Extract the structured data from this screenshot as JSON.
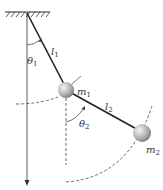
{
  "diagram": {
    "labels": {
      "l1": {
        "main": "l",
        "sub": "1"
      },
      "l2": {
        "main": "l",
        "sub": "2"
      },
      "theta1": {
        "main": "θ",
        "sub": "1"
      },
      "theta2": {
        "main": "θ",
        "sub": "2"
      },
      "m1": {
        "main": "m",
        "sub": "1"
      },
      "m2": {
        "main": "m",
        "sub": "2"
      }
    },
    "colors": {
      "line": "#222222",
      "dashed": "#444444",
      "mass_light": "#f2f2f2",
      "mass_dark": "#8a8a8a"
    }
  }
}
